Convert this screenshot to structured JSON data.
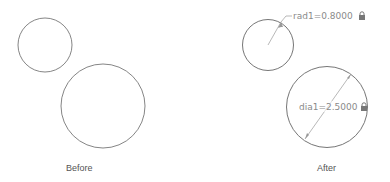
{
  "panels": [
    {
      "caption": "Before",
      "circles": [
        {
          "name": "small-circle"
        },
        {
          "name": "large-circle"
        }
      ]
    },
    {
      "caption": "After",
      "circles": [
        {
          "name": "small-circle",
          "dimension": {
            "type": "radius",
            "label": "rad1=0.8000",
            "locked": true
          }
        },
        {
          "name": "large-circle",
          "dimension": {
            "type": "diameter",
            "label": "dia1=2.5000",
            "locked": true
          }
        }
      ]
    }
  ],
  "colors": {
    "circle_stroke": "#666666",
    "dimension": "#8a8a8a",
    "caption": "#555555"
  },
  "icons": {
    "lock": "lock-icon"
  }
}
